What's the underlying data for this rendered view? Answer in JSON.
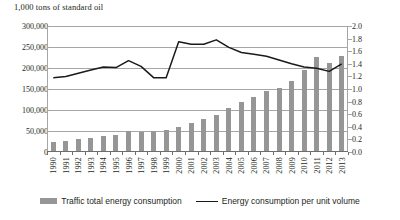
{
  "chart_data": {
    "type": "bar",
    "title": "1,000 tons of standard oil",
    "xlabel": "",
    "ylabel": "1,000 tons of standard oil",
    "ylabel_right": "",
    "grid": true,
    "legend_position": "bottom",
    "categories": [
      "1990",
      "1991",
      "1992",
      "1993",
      "1994",
      "1995",
      "1996",
      "1997",
      "1998",
      "1999",
      "2000",
      "2001",
      "2002",
      "2003",
      "2004",
      "2005",
      "2006",
      "2007",
      "2008",
      "2009",
      "2010",
      "2011",
      "2012",
      "2013"
    ],
    "ylim": [
      0,
      300000
    ],
    "yticks": [
      "0",
      "50,000",
      "100,000",
      "150,000",
      "200,000",
      "250,000",
      "300,000"
    ],
    "ylim_right": [
      0,
      2.0
    ],
    "yticks_right": [
      "0.0",
      "0.2",
      "0.4",
      "0.6",
      "0.8",
      "1.0",
      "1.2",
      "1.4",
      "1.6",
      "1.8",
      "2.0"
    ],
    "series": [
      {
        "name": "Traffic total energy consumption",
        "type": "bar",
        "axis": "left",
        "color": "#969696",
        "values": [
          25000,
          27000,
          30000,
          34000,
          37000,
          41000,
          49000,
          48000,
          49000,
          53000,
          60000,
          69000,
          78000,
          88000,
          105000,
          120000,
          132000,
          145000,
          152000,
          168000,
          196000,
          226000,
          212000,
          228000
        ]
      },
      {
        "name": "Energy consumption per unit volume",
        "type": "line",
        "axis": "right",
        "color": "#1a1a1a",
        "values": [
          1.18,
          1.2,
          1.25,
          1.3,
          1.35,
          1.34,
          1.45,
          1.36,
          1.18,
          1.18,
          1.75,
          1.71,
          1.71,
          1.78,
          1.66,
          1.58,
          1.55,
          1.52,
          1.46,
          1.4,
          1.35,
          1.33,
          1.28,
          1.4
        ]
      }
    ]
  },
  "legend": {
    "bar_label": "Traffic total energy consumption",
    "line_label": "Energy consumption per unit volume"
  }
}
